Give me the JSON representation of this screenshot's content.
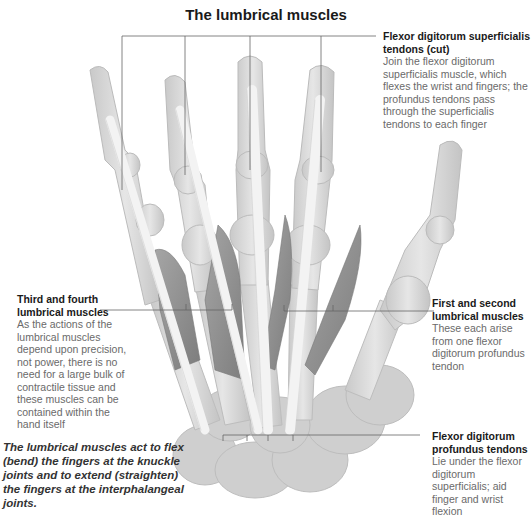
{
  "title": "The lumbrical muscles",
  "labels": {
    "fds": {
      "heading": "Flexor digitorum superficialis tendons (cut)",
      "body": "Join the flexor digitorum superficialis muscle, which flexes the wrist and fingers; the profundus tendons pass through the superficialis tendons to each finger"
    },
    "third_fourth": {
      "heading": "Third and fourth lumbrical muscles",
      "body": "As the actions of the lumbrical muscles depend upon precision, not power, there is no need for a large bulk of contractile tissue and these muscles can be contained within the hand itself"
    },
    "first_second": {
      "heading": "First and second lumbrical muscles",
      "body": "These each arise from one flexor digitorum profundus tendon"
    },
    "fdp": {
      "heading": "Flexor digitorum profundus tendons",
      "body": "Lie under the flexor digitorum superficialis; aid finger and wrist flexion"
    }
  },
  "caption": "The lumbrical muscles act to flex (bend) the fingers at the knuckle joints and to extend (straighten) the fingers at the interphalangeal joints.",
  "colors": {
    "bone": "#d9d9d9",
    "bone_edge": "#b8b8b8",
    "muscle": "#8f8f8f",
    "tendon": "#f4f4f4",
    "leader": "#666666"
  }
}
